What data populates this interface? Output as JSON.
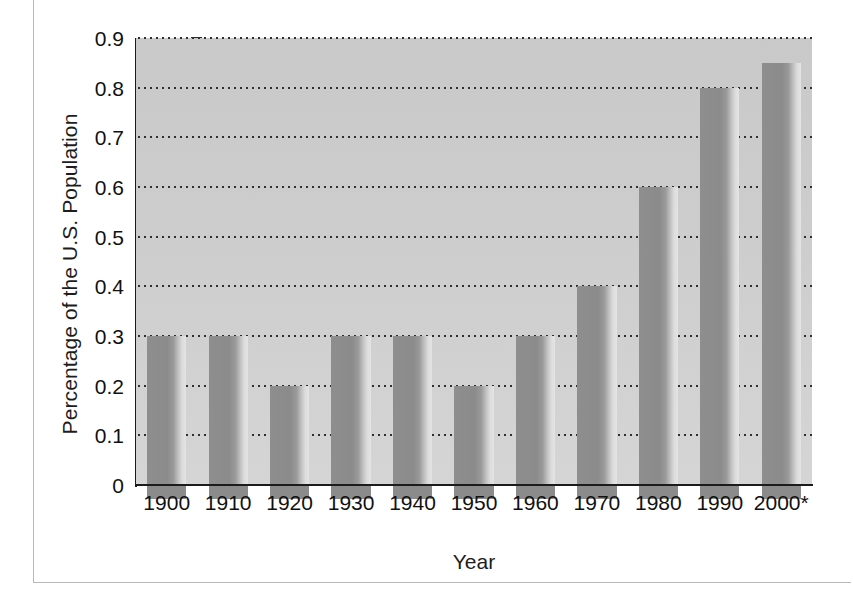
{
  "chart_data": {
    "type": "bar",
    "title": "",
    "xlabel": "Year",
    "ylabel": "Percentage of the U.S. Population",
    "categories": [
      "1900",
      "1910",
      "1920",
      "1930",
      "1940",
      "1950",
      "1960",
      "1970",
      "1980",
      "1990",
      "2000*"
    ],
    "values": [
      0.3,
      0.3,
      0.2,
      0.3,
      0.3,
      0.2,
      0.3,
      0.4,
      0.6,
      0.8,
      0.85
    ],
    "ylim": [
      0,
      0.9
    ],
    "ytick_labels": [
      "0",
      "0.1",
      "0.2",
      "0.3",
      "0.4",
      "0.5",
      "0.6",
      "0.7",
      "0.8",
      "0.9"
    ],
    "ytick_values": [
      0,
      0.1,
      0.2,
      0.3,
      0.4,
      0.5,
      0.6,
      0.7,
      0.8,
      0.9
    ],
    "grid": true,
    "grid_style": "dotted-horizontal",
    "legend": "none",
    "series": [
      {
        "name": "Percentage of the U.S. Population",
        "values": [
          0.3,
          0.3,
          0.2,
          0.3,
          0.3,
          0.2,
          0.3,
          0.4,
          0.6,
          0.8,
          0.85
        ]
      }
    ],
    "annotations": [
      "2000 value is marked with an asterisk"
    ],
    "colors": {
      "plot_background": "#cdcdcd",
      "bar_fill": "#8b8b8b",
      "bar_highlight": "#e4e4e4",
      "axis": "#1b1b1b",
      "gridline": "#2f2f2f",
      "text": "#111111",
      "frame": "#b9b9b9",
      "page_background": "#ffffff"
    }
  }
}
